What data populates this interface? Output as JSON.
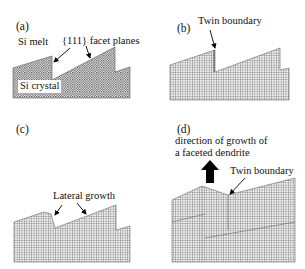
{
  "figure": {
    "panels": [
      {
        "id": "a",
        "label": "(a)",
        "annotations": {
          "melt": "Si melt",
          "facets": "{111} facet planes",
          "crystal": "Si crystal"
        }
      },
      {
        "id": "b",
        "label": "(b)",
        "annotations": {
          "twin": "Twin boundary"
        }
      },
      {
        "id": "c",
        "label": "(c)",
        "annotations": {
          "lateral": "Lateral growth"
        }
      },
      {
        "id": "d",
        "label": "(d)",
        "annotations": {
          "direction_line1": "direction of growth of",
          "direction_line2": "a faceted dendrite",
          "twin": "Twin boundary"
        }
      }
    ],
    "colors": {
      "crystal_grid": "#555555",
      "crystal_fill": "#d8d8d8",
      "arrow": "#000000"
    }
  }
}
